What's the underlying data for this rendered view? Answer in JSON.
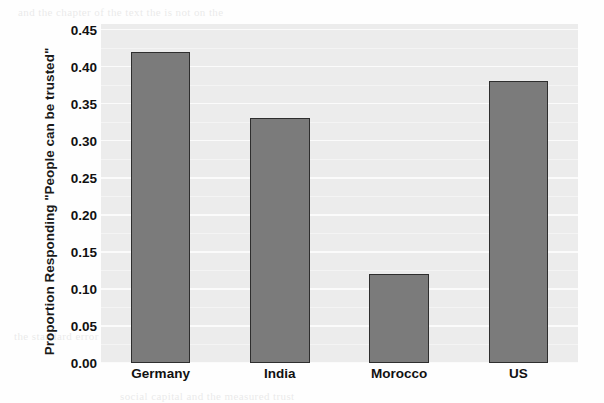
{
  "chart_data": {
    "type": "bar",
    "title": "",
    "subtitle": "",
    "xlabel": "",
    "ylabel": "Proportion Responding \"People can be trusted\"",
    "categories": [
      "Germany",
      "India",
      "Morocco",
      "US"
    ],
    "values": [
      0.42,
      0.33,
      0.12,
      0.38
    ],
    "series": [
      {
        "name": "Proportion Responding \"People can be trusted\"",
        "values": [
          0.42,
          0.33,
          0.12,
          0.38
        ]
      }
    ],
    "ylim": [
      0.0,
      0.4575
    ],
    "xlim": [
      0,
      4
    ],
    "y_ticks": [
      0.0,
      0.05,
      0.1,
      0.15,
      0.2,
      0.25,
      0.3,
      0.35,
      0.4,
      0.45
    ],
    "y_tick_labels": [
      "0.00",
      "0.05",
      "0.10",
      "0.15",
      "0.20",
      "0.25",
      "0.30",
      "0.35",
      "0.40",
      "0.45"
    ],
    "x_tick_labels": [
      "Germany",
      "India",
      "Morocco",
      "US"
    ],
    "grid": true,
    "grid_axis": "y",
    "grid_color": "#fbfbfb",
    "legend": false,
    "legend_position": "none",
    "bar_color": "#7b7b7b",
    "bar_edge_color": "#2e2e2e",
    "plot_background": "#ececec",
    "figure_background": "#fefefe",
    "text_color": "#111111",
    "bar_width_fraction": 0.5,
    "annotations": []
  },
  "axes": {
    "y_title": "Proportion Responding \"People can be trusted\"",
    "x_title": ""
  },
  "scan_artifacts": {
    "description": "faint bleed-through text from reverse side of printed page",
    "lines": [
      "and the chapter of the text the is not on the",
      "of trust in the sample of respondents",
      "TRUST",
      "NORMS",
      "and the values of the measure in the table",
      "survey results compared across countries",
      "the standard error of the proportion",
      "social capital and the measured trust"
    ]
  }
}
